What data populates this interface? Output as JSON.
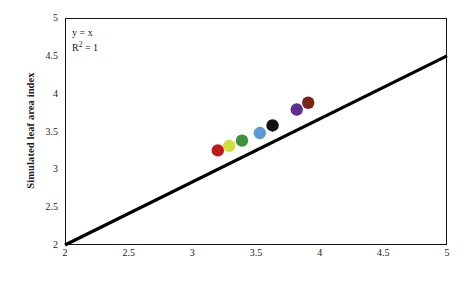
{
  "chart_data": {
    "type": "scatter",
    "title": "",
    "xlabel": "Observed leaf area index",
    "ylabel": "Simulated leaf area index",
    "xlim": [
      2,
      5
    ],
    "ylim": [
      2,
      5
    ],
    "xticks": [
      "2",
      "2.5",
      "3",
      "3.5",
      "4",
      "4.5",
      "5"
    ],
    "yticks": [
      "2",
      "2.5",
      "3",
      "3.5",
      "4",
      "4.5",
      "5"
    ],
    "xtick_values": [
      2,
      2.5,
      3,
      3.5,
      4,
      4.5,
      5
    ],
    "ytick_values": [
      2,
      2.5,
      3,
      3.5,
      4,
      4.5,
      5
    ],
    "grid": false,
    "legend": "none",
    "annotations": [
      {
        "text_equation": "y = x",
        "text_r2_base": "R",
        "text_r2_sup": "2",
        "text_r2_rest": " = 1"
      }
    ],
    "trendline": {
      "name": "one-to-one-line",
      "x": [
        2,
        5
      ],
      "y": [
        2,
        4.5
      ],
      "color": "#000000",
      "width": 3.2
    },
    "points": [
      {
        "x": 3.2,
        "y": 3.25,
        "color": "#C0181B",
        "label": "red-point"
      },
      {
        "x": 3.29,
        "y": 3.31,
        "color": "#D2DD3A",
        "label": "yellow-green-point"
      },
      {
        "x": 3.39,
        "y": 3.38,
        "color": "#3F8F3C",
        "label": "green-point"
      },
      {
        "x": 3.53,
        "y": 3.48,
        "color": "#5B9BD5",
        "label": "blue-point"
      },
      {
        "x": 3.63,
        "y": 3.58,
        "color": "#111111",
        "label": "black-point"
      },
      {
        "x": 3.82,
        "y": 3.79,
        "color": "#5B2D8E",
        "label": "purple-point"
      },
      {
        "x": 3.91,
        "y": 3.88,
        "color": "#7B2418",
        "label": "dark-red-point"
      }
    ],
    "marker_radius": 6.2
  }
}
